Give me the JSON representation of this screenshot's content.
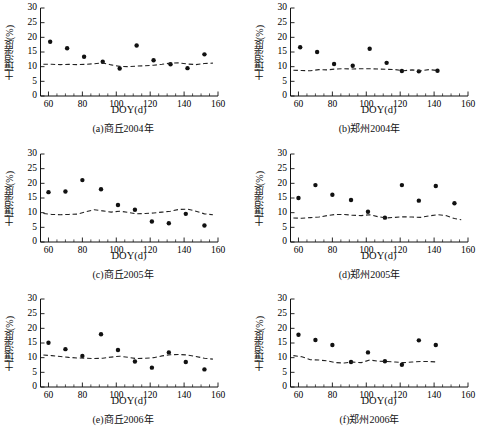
{
  "figure": {
    "xlabel": "DOY(d)",
    "ylabel": "土壤湿度(%)",
    "xlim": [
      55,
      160
    ],
    "ylim": [
      0,
      30
    ],
    "xticks": [
      60,
      80,
      100,
      120,
      140,
      160
    ],
    "yticks": [
      0,
      5,
      10,
      15,
      20,
      25,
      30
    ],
    "xtick_labels": [
      "60",
      "80",
      "100",
      "120",
      "140",
      "160"
    ],
    "ytick_labels": [
      "0",
      "5",
      "10",
      "15",
      "20",
      "25",
      "30"
    ],
    "marker_color": "#111111",
    "line_color": "#222222"
  },
  "chart_data": [
    {
      "type": "scatter",
      "id": "a",
      "caption": "(a)商丘2004年",
      "title": "",
      "xlabel": "DOY(d)",
      "ylabel": "土壤湿度(%)",
      "xlim": [
        55,
        160
      ],
      "ylim": [
        0,
        30
      ],
      "grid": false,
      "legend": "none",
      "series": [
        {
          "name": "观测值",
          "kind": "scatter",
          "x": [
            61,
            71,
            81,
            92,
            102,
            112,
            122,
            132,
            142,
            152
          ],
          "values": [
            18.5,
            16.3,
            13.4,
            11.7,
            9.4,
            17.2,
            12.2,
            10.8,
            9.5,
            14.2
          ]
        },
        {
          "name": "模拟值",
          "kind": "dashed-line",
          "x": [
            57,
            62,
            67,
            72,
            77,
            82,
            87,
            92,
            97,
            102,
            107,
            112,
            117,
            122,
            127,
            132,
            137,
            142,
            147,
            152,
            157
          ],
          "values": [
            10.8,
            10.8,
            10.7,
            10.8,
            10.7,
            10.8,
            11.0,
            11.3,
            10.6,
            10.1,
            10.0,
            10.2,
            10.3,
            10.5,
            10.8,
            11.2,
            11.3,
            10.9,
            10.7,
            11.1,
            11.2
          ]
        }
      ]
    },
    {
      "type": "scatter",
      "id": "b",
      "caption": "(b)郑州2004年",
      "title": "",
      "xlabel": "DOY(d)",
      "ylabel": "土壤湿度(%)",
      "xlim": [
        55,
        160
      ],
      "ylim": [
        0,
        30
      ],
      "grid": false,
      "legend": "none",
      "series": [
        {
          "name": "观测值",
          "kind": "scatter",
          "x": [
            61,
            71,
            81,
            92,
            102,
            112,
            121,
            131,
            142
          ],
          "values": [
            16.6,
            15.0,
            10.9,
            10.3,
            16.1,
            11.3,
            8.5,
            8.4,
            8.6
          ]
        },
        {
          "name": "模拟值",
          "kind": "dashed-line",
          "x": [
            57,
            62,
            67,
            72,
            77,
            82,
            87,
            92,
            97,
            102,
            107,
            112,
            117,
            122,
            127,
            132,
            137,
            142
          ],
          "values": [
            8.8,
            8.7,
            8.6,
            9.0,
            8.9,
            9.2,
            9.3,
            9.2,
            9.3,
            9.3,
            9.2,
            9.1,
            9.0,
            8.6,
            8.9,
            8.6,
            9.0,
            8.7
          ]
        }
      ]
    },
    {
      "type": "scatter",
      "id": "c",
      "caption": "(c)商丘2005年",
      "title": "",
      "xlabel": "DOY(d)",
      "ylabel": "土壤湿度(%)",
      "xlim": [
        55,
        160
      ],
      "ylim": [
        0,
        30
      ],
      "grid": false,
      "legend": "none",
      "series": [
        {
          "name": "观测值",
          "kind": "scatter",
          "x": [
            60,
            70,
            80,
            91,
            101,
            111,
            121,
            131,
            141,
            152
          ],
          "values": [
            17.0,
            17.2,
            21.1,
            18.0,
            12.6,
            11.0,
            7.0,
            6.4,
            9.6,
            5.6
          ]
        },
        {
          "name": "模拟值",
          "kind": "dashed-line",
          "x": [
            57,
            62,
            67,
            72,
            77,
            82,
            87,
            92,
            97,
            102,
            107,
            112,
            117,
            122,
            127,
            132,
            137,
            142,
            147,
            152,
            157
          ],
          "values": [
            9.7,
            9.4,
            9.3,
            9.4,
            9.5,
            10.3,
            11.0,
            10.6,
            10.2,
            10.5,
            10.1,
            9.6,
            9.7,
            9.9,
            10.2,
            10.5,
            11.1,
            11.2,
            10.5,
            9.6,
            9.3
          ]
        }
      ]
    },
    {
      "type": "scatter",
      "id": "d",
      "caption": "(d)郑州2005年",
      "title": "",
      "xlabel": "DOY(d)",
      "ylabel": "土壤湿度(%)",
      "xlim": [
        55,
        160
      ],
      "ylim": [
        0,
        30
      ],
      "grid": false,
      "legend": "none",
      "series": [
        {
          "name": "观测值",
          "kind": "scatter",
          "x": [
            60,
            70,
            80,
            91,
            101,
            111,
            121,
            131,
            141,
            152
          ],
          "values": [
            15.0,
            19.4,
            16.1,
            14.3,
            10.3,
            8.3,
            19.4,
            14.1,
            19.1,
            13.2
          ]
        },
        {
          "name": "模拟值",
          "kind": "dashed-line",
          "x": [
            57,
            62,
            67,
            72,
            77,
            82,
            87,
            92,
            97,
            102,
            107,
            112,
            117,
            122,
            127,
            132,
            137,
            142,
            147,
            152,
            156
          ],
          "values": [
            8.2,
            8.1,
            8.3,
            8.5,
            9.0,
            9.4,
            9.4,
            9.1,
            9.0,
            9.3,
            8.6,
            8.2,
            8.4,
            8.6,
            8.5,
            8.4,
            8.9,
            9.3,
            9.0,
            8.0,
            7.6
          ]
        }
      ]
    },
    {
      "type": "scatter",
      "id": "e",
      "caption": "(e)商丘2006年",
      "title": "",
      "xlabel": "DOY(d)",
      "ylabel": "土壤湿度(%)",
      "xlim": [
        55,
        160
      ],
      "ylim": [
        0,
        30
      ],
      "grid": false,
      "legend": "none",
      "series": [
        {
          "name": "观测值",
          "kind": "scatter",
          "x": [
            60,
            70,
            80,
            91,
            101,
            111,
            121,
            131,
            141,
            152
          ],
          "values": [
            15.1,
            12.9,
            10.6,
            18.0,
            12.6,
            8.7,
            6.6,
            11.8,
            8.5,
            6.0
          ]
        },
        {
          "name": "模拟值",
          "kind": "dashed-line",
          "x": [
            57,
            62,
            67,
            72,
            77,
            82,
            87,
            92,
            97,
            102,
            107,
            112,
            117,
            122,
            127,
            132,
            137,
            142,
            147,
            152,
            157
          ],
          "values": [
            10.9,
            10.7,
            10.4,
            10.1,
            9.9,
            9.8,
            9.7,
            9.8,
            10.2,
            10.5,
            10.1,
            9.7,
            9.8,
            10.0,
            10.6,
            11.0,
            11.1,
            10.9,
            10.4,
            9.8,
            9.5
          ]
        }
      ]
    },
    {
      "type": "scatter",
      "id": "f",
      "caption": "(f)郑州2006年",
      "title": "",
      "xlabel": "DOY(d)",
      "ylabel": "土壤湿度(%)",
      "xlim": [
        55,
        160
      ],
      "ylim": [
        0,
        30
      ],
      "grid": false,
      "legend": "none",
      "series": [
        {
          "name": "观测值",
          "kind": "scatter",
          "x": [
            60,
            70,
            80,
            91,
            101,
            111,
            121,
            131,
            141
          ],
          "values": [
            17.8,
            16.0,
            14.3,
            8.5,
            11.8,
            8.8,
            7.6,
            15.9,
            14.3
          ]
        },
        {
          "name": "模拟值",
          "kind": "dashed-line",
          "x": [
            57,
            62,
            67,
            72,
            77,
            82,
            87,
            92,
            97,
            102,
            107,
            112,
            117,
            122,
            127,
            132,
            137,
            142
          ],
          "values": [
            10.7,
            10.3,
            9.3,
            9.2,
            8.9,
            8.3,
            8.2,
            8.5,
            8.3,
            9.2,
            8.8,
            8.7,
            8.5,
            8.3,
            8.5,
            8.7,
            8.7,
            8.5
          ]
        }
      ]
    }
  ]
}
